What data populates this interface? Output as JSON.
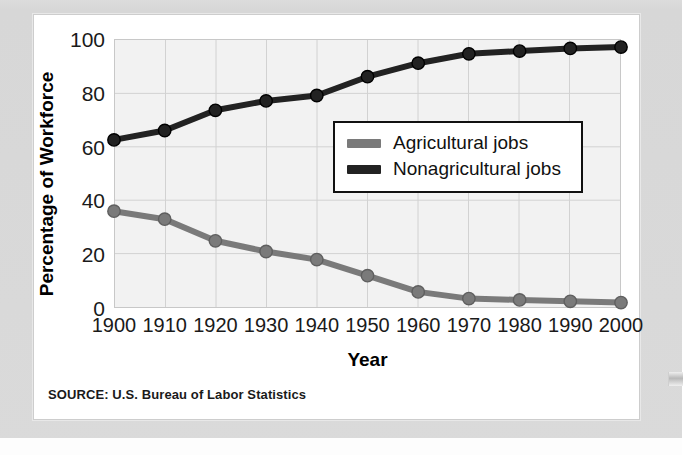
{
  "figure": {
    "source_note": "SOURCE: U.S. Bureau of Labor Statistics"
  },
  "chart_data": {
    "type": "line",
    "title": "",
    "xlabel": "Year",
    "ylabel": "Percentage of Workforce",
    "categories": [
      "1900",
      "1910",
      "1920",
      "1930",
      "1940",
      "1950",
      "1960",
      "1970",
      "1980",
      "1990",
      "2000"
    ],
    "x": [
      1900,
      1910,
      1920,
      1930,
      1940,
      1950,
      1960,
      1970,
      1980,
      1990,
      2000
    ],
    "xlim": [
      1900,
      2000
    ],
    "ylim": [
      0,
      100
    ],
    "yticks": [
      0,
      20,
      40,
      60,
      80,
      100
    ],
    "xticks": [
      1900,
      1910,
      1920,
      1930,
      1940,
      1950,
      1960,
      1970,
      1980,
      1990,
      2000
    ],
    "grid": true,
    "legend_position": "center-right",
    "series": [
      {
        "name": "Agricultural jobs",
        "color": "#7a7a7a",
        "values": [
          36,
          33,
          25,
          21,
          18,
          12,
          6,
          3.5,
          3,
          2.5,
          2
        ]
      },
      {
        "name": "Nonagricultural jobs",
        "color": "#222222",
        "values": [
          62.5,
          66,
          73.5,
          77,
          79,
          86,
          91,
          94.5,
          95.5,
          96.5,
          97
        ]
      }
    ]
  }
}
